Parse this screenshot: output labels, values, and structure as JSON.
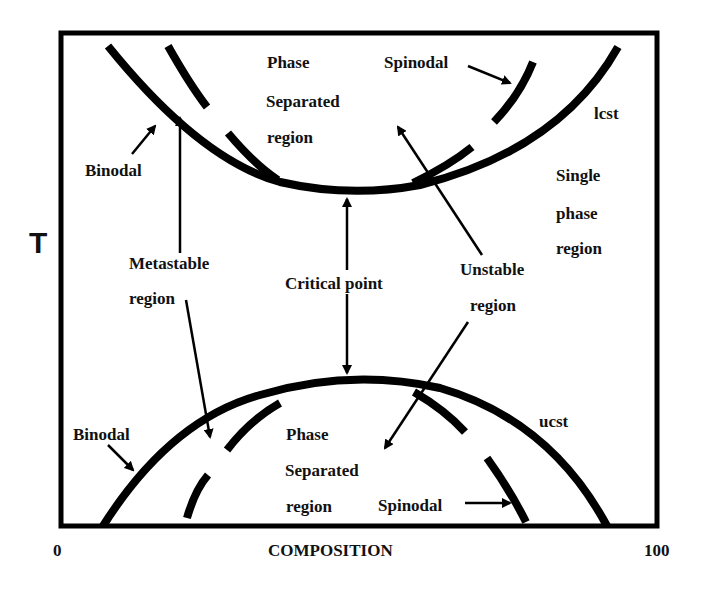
{
  "diagram": {
    "type": "phase-diagram",
    "axes": {
      "y_label": "T",
      "x_label": "COMPOSITION",
      "x_min_label": "0",
      "x_max_label": "100"
    },
    "upper": {
      "region_label": [
        "Phase",
        "Separated",
        "region"
      ],
      "spinodal_label": "Spinodal",
      "binodal_label": "Binodal",
      "curve_label": "lcst",
      "single_phase_label": [
        "Single",
        "phase",
        "region"
      ]
    },
    "center": {
      "metastable_label": [
        "Metastable",
        "region"
      ],
      "critical_point_label": "Critical point",
      "unstable_label": [
        "Unstable",
        "region"
      ]
    },
    "lower": {
      "binodal_label": "Binodal",
      "region_label": [
        "Phase",
        "Separated",
        "region"
      ],
      "spinodal_label": "Spinodal",
      "curve_label": "ucst"
    }
  }
}
